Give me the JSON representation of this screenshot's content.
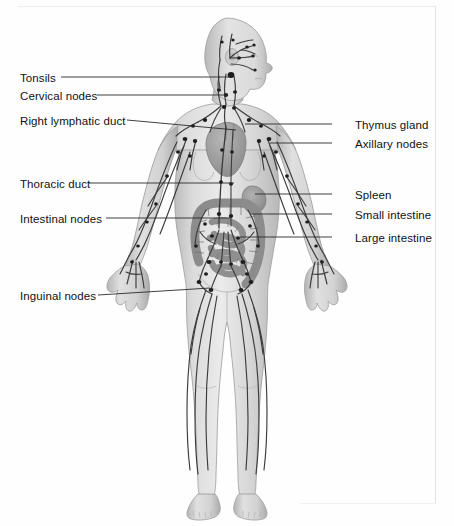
{
  "figure": {
    "body_view": "anterior full body, head turned to profile facing viewer's right",
    "colors": {
      "background": "#fefefe",
      "body_fill": "#d8d8d8",
      "body_shade": "#b4b4b4",
      "vessel": "#3c3c3c",
      "node": "#1e1e1e",
      "organ": "#9a9a9a",
      "leader_line": "#2a2a2a",
      "text": "#111111",
      "frame": "#e2e2e2"
    }
  },
  "labels_left": [
    {
      "text": "Tonsils",
      "x": 20,
      "y": 72,
      "line_x1": 61,
      "line_y1": 77,
      "line_x2": 231,
      "line_y2": 77
    },
    {
      "text": "Cervical nodes",
      "x": 20,
      "y": 90,
      "line_x1": 97,
      "line_y1": 95,
      "line_x2": 227,
      "line_y2": 95
    },
    {
      "text": "Right lymphatic duct",
      "x": 20,
      "y": 115,
      "line_x1": 127,
      "line_y1": 120,
      "line_x2": 236,
      "line_y2": 130
    },
    {
      "text": "Thoracic duct",
      "x": 20,
      "y": 178,
      "line_x1": 89,
      "line_y1": 183,
      "line_x2": 234,
      "line_y2": 183
    },
    {
      "text": "Intestinal nodes",
      "x": 20,
      "y": 213,
      "line_x1": 106,
      "line_y1": 218,
      "line_x2": 231,
      "line_y2": 218
    },
    {
      "text": "Inguinal nodes",
      "x": 20,
      "y": 290,
      "line_x1": 98,
      "line_y1": 295,
      "line_x2": 210,
      "line_y2": 288
    }
  ],
  "labels_right": [
    {
      "text": "Thymus gland",
      "x": 355,
      "y": 119,
      "line_x1": 332,
      "line_y1": 124,
      "line_x2": 245,
      "line_y2": 124
    },
    {
      "text": "Axillary nodes",
      "x": 355,
      "y": 138,
      "line_x1": 332,
      "line_y1": 143,
      "line_x2": 270,
      "line_y2": 143
    },
    {
      "text": "Spleen",
      "x": 355,
      "y": 189,
      "line_x1": 332,
      "line_y1": 194,
      "line_x2": 255,
      "line_y2": 194
    },
    {
      "text": "Small intestine",
      "x": 355,
      "y": 209,
      "line_x1": 332,
      "line_y1": 214,
      "line_x2": 250,
      "line_y2": 214
    },
    {
      "text": "Large intestine",
      "x": 355,
      "y": 232,
      "line_x1": 332,
      "line_y1": 237,
      "line_x2": 240,
      "line_y2": 237
    }
  ],
  "anatomy_parts": [
    "head",
    "neck",
    "torso",
    "left arm",
    "right arm",
    "left hand",
    "right hand",
    "left leg",
    "right leg",
    "left foot",
    "right foot",
    "heart",
    "thymus",
    "spleen",
    "small intestine",
    "large intestine"
  ]
}
